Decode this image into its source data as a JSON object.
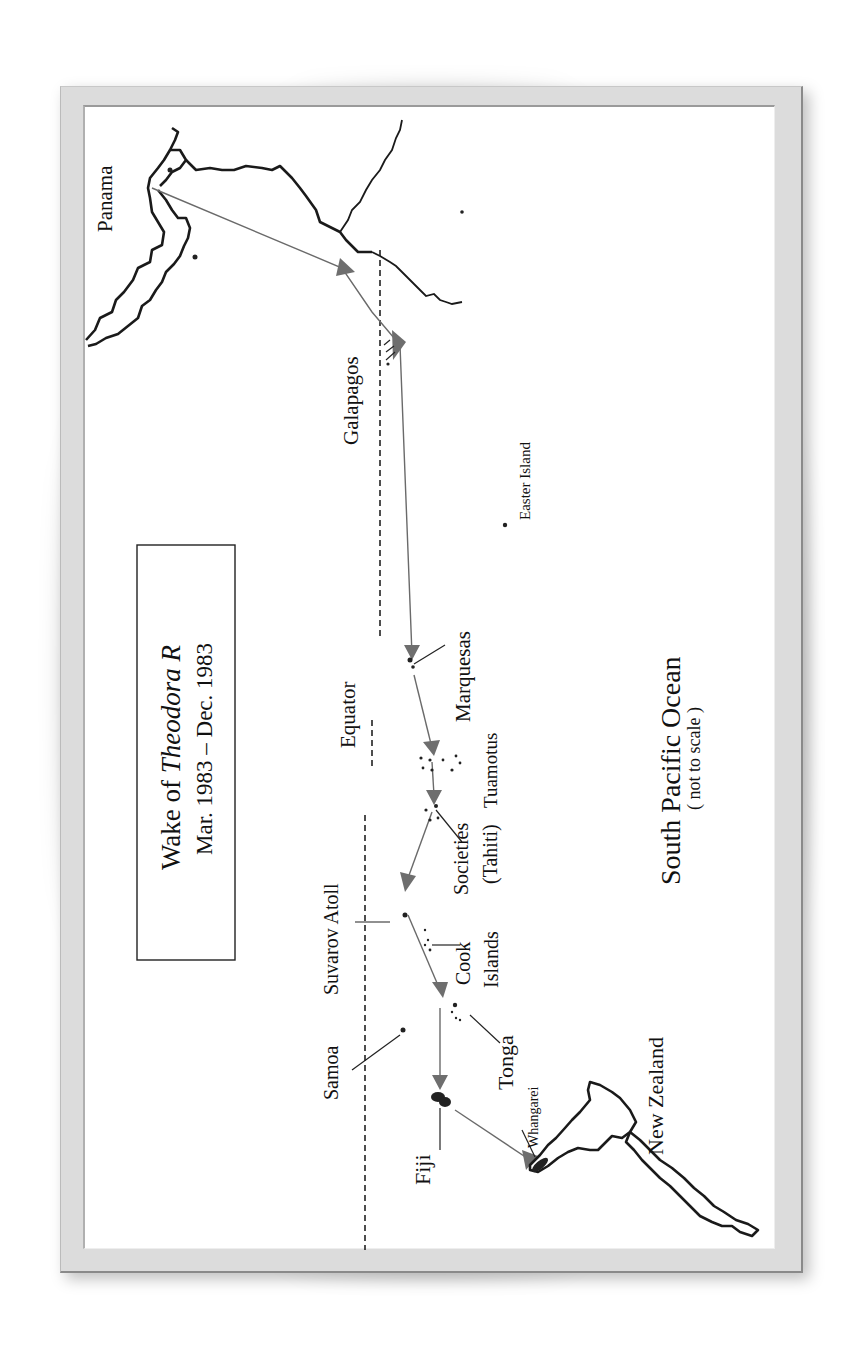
{
  "title_box": {
    "line1_prefix": "Wake of ",
    "line1_vessel": "Theodora R",
    "line2": "Mar. 1983 – Dec. 1983"
  },
  "places": {
    "panama": "Panama",
    "galapagos": "Galapagos",
    "easter_island": "Easter Island",
    "marquesas": "Marquesas",
    "tuamotus": "Tuamotus",
    "societies": "Societies",
    "tahiti": "(Tahiti)",
    "suvarov_atoll": "Suvarov Atoll",
    "cook": "Cook",
    "islands": "Islands",
    "samoa": "Samoa",
    "tonga": "Tonga",
    "fiji": "Fiji",
    "whangarei": "Whangarei",
    "new_zealand": "New Zealand",
    "equator": "Equator"
  },
  "ocean": {
    "name": "South Pacific Ocean",
    "note": "( not to scale )"
  },
  "route": [
    "Panama",
    "Galapagos",
    "Marquesas",
    "Tuamotus",
    "Societies (Tahiti)",
    "Suvarov Atoll",
    "Tonga",
    "Fiji",
    "Whangarei"
  ],
  "colors": {
    "route": "#6a6a6a",
    "coastline": "#1a1a1a",
    "frame": "#dcdcdc",
    "background": "#ffffff"
  }
}
